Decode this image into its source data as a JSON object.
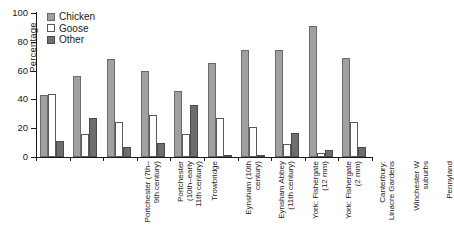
{
  "chart_data": {
    "type": "bar",
    "title": "",
    "xlabel": "",
    "ylabel": "Percentage",
    "ylim": [
      0,
      100
    ],
    "yticks": [
      0,
      20,
      40,
      60,
      80,
      100
    ],
    "grid": false,
    "legend_position": "top-left",
    "categories": [
      "Portchester (7th–9th century)",
      "Portchester (10th–early 11th century)",
      "Trowbridge",
      "Eynsham (10th century)",
      "Eynsham Abbey (11th century)",
      "York: Fishergate (12 mm)",
      "York: Fishergate (2 mm)",
      "Canterbury: Linacre Gardens",
      "Winchester W suburbs",
      "Pennyland"
    ],
    "category_lines": [
      [
        "Portchester (7th–",
        "9th century)"
      ],
      [
        "Portchester",
        "(10th–early",
        "11th century)"
      ],
      [
        "Trowbridge"
      ],
      [
        "Eynsham (10th",
        "century)"
      ],
      [
        "Eynsham Abbey",
        "(11th century)"
      ],
      [
        "York: Fishergate",
        "(12 mm)"
      ],
      [
        "York: Fishergate",
        "(2 mm)"
      ],
      [
        "Canterbury:",
        "Linacre Gardens"
      ],
      [
        "Winchester W",
        "suburbs"
      ],
      [
        "Pennyland"
      ]
    ],
    "series": [
      {
        "name": "Chicken",
        "color": "#a0a0a0",
        "values": [
          43,
          56,
          68,
          60,
          46,
          65,
          74,
          74,
          91,
          69
        ]
      },
      {
        "name": "Goose",
        "color": "#ffffff",
        "values": [
          44,
          16,
          24,
          29,
          16,
          27,
          21,
          9,
          3,
          24
        ]
      },
      {
        "name": "Other",
        "color": "#6e6e6e",
        "values": [
          11,
          27,
          7,
          10,
          36,
          1,
          1,
          17,
          5,
          7
        ]
      }
    ]
  },
  "legend": {
    "items": [
      {
        "label": "Chicken",
        "key": "chicken"
      },
      {
        "label": "Goose",
        "key": "goose"
      },
      {
        "label": "Other",
        "key": "other"
      }
    ]
  },
  "colors": {
    "chicken": "#a0a0a0",
    "goose": "#ffffff",
    "other": "#6e6e6e",
    "axis": "#1a1a1a",
    "background": "#ffffff"
  }
}
